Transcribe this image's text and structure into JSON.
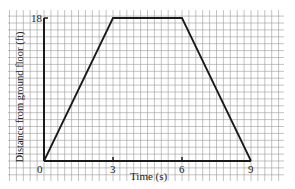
{
  "chart_data": {
    "type": "line",
    "title": "",
    "xlabel": "Time (s)",
    "ylabel": "Distance from ground floor (ft)",
    "x": [
      0,
      3,
      6,
      9
    ],
    "series": [
      {
        "name": "Distance",
        "values": [
          0,
          18,
          18,
          0
        ]
      }
    ],
    "x_ticks": [
      "0",
      "3",
      "6",
      "9"
    ],
    "y_ticks": [
      "18"
    ],
    "xlim": [
      0,
      9
    ],
    "ylim": [
      0,
      18
    ],
    "grid": true,
    "legend": "none"
  },
  "labels": {
    "origin": "0",
    "x3": "3",
    "x6": "6",
    "x9": "9",
    "y18": "18",
    "xlabel": "Time (s)",
    "ylabel": "Distance from ground floor (ft)"
  },
  "colors": {
    "grid": "#9a9a9a",
    "line": "#1a1a1a",
    "background": "#ffffff"
  }
}
